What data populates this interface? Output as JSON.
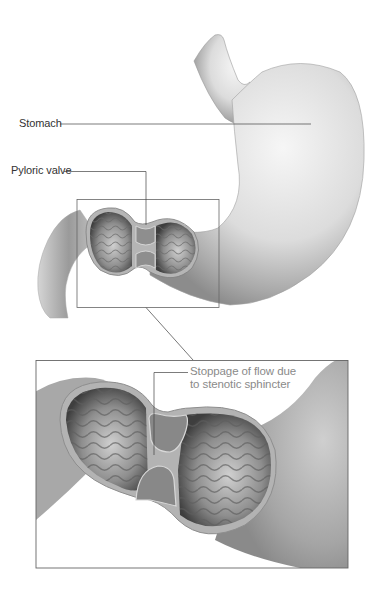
{
  "labels": {
    "stomach": "Stomach",
    "pyloric_valve": "Pyloric valve",
    "stoppage_line1": "Stoppage of flow due",
    "stoppage_line2": "to stenotic sphincter"
  },
  "colors": {
    "background": "#ffffff",
    "label_text": "#333333",
    "callout_text": "#8a8a8a",
    "leader_line": "#444444",
    "frame": "#666666",
    "tissue_light": "#e8e8e8",
    "tissue_mid": "#bdbdbd",
    "tissue_dark": "#7a7a7a",
    "lumen_dark": "#3a3a3a"
  }
}
